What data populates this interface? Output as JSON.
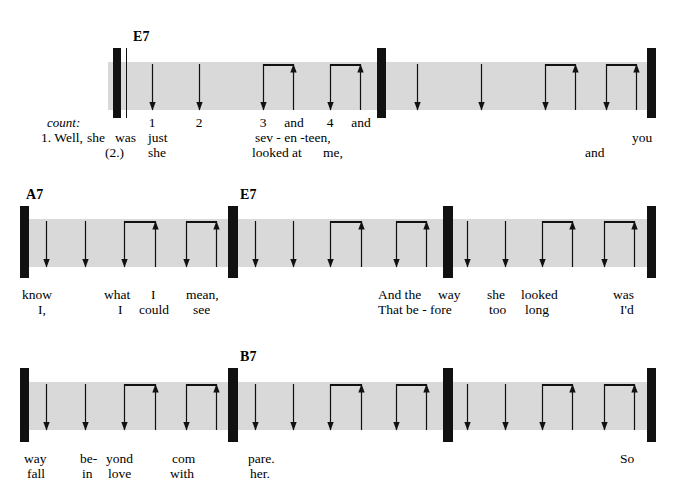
{
  "colors": {
    "band": "#d9d9d9",
    "ink": "#111111",
    "page": "#ffffff"
  },
  "labels": {
    "count": "count:"
  },
  "systems": [
    {
      "id": "system-1",
      "chords": [
        {
          "name": "E7",
          "x": 133,
          "y": 30
        }
      ],
      "measures": [
        {
          "id": "measure-1",
          "chord": "E7",
          "strokes": [
            {
              "beat": "1",
              "dir": "down",
              "x": 152
            },
            {
              "beat": "2",
              "dir": "down",
              "x": 199
            },
            {
              "beat": "3",
              "dir": "down",
              "x": 263
            },
            {
              "beat": "and",
              "dir": "up",
              "x": 293
            },
            {
              "beat": "4",
              "dir": "down",
              "x": 330
            },
            {
              "beat": "and",
              "dir": "up",
              "x": 360
            }
          ],
          "beams": [
            {
              "x1": 263,
              "x2": 293
            },
            {
              "x1": 330,
              "x2": 360
            }
          ]
        },
        {
          "id": "measure-2",
          "chord": "E7",
          "strokes": [
            {
              "beat": "1",
              "dir": "down",
              "x": 417
            },
            {
              "beat": "2",
              "dir": "down",
              "x": 481
            },
            {
              "beat": "3",
              "dir": "down",
              "x": 545
            },
            {
              "beat": "and",
              "dir": "up",
              "x": 575
            },
            {
              "beat": "4",
              "dir": "down",
              "x": 606
            },
            {
              "beat": "and",
              "dir": "up",
              "x": 636
            }
          ],
          "beams": [
            {
              "x1": 545,
              "x2": 575
            },
            {
              "x1": 606,
              "x2": 636
            }
          ]
        }
      ],
      "count_row": [
        {
          "text": "1",
          "x": 152
        },
        {
          "text": "2",
          "x": 199
        },
        {
          "text": "3",
          "x": 263
        },
        {
          "text": "and",
          "x": 294
        },
        {
          "text": "4",
          "x": 330
        },
        {
          "text": "and",
          "x": 361
        }
      ],
      "verse1": [
        {
          "text": "1. Well,",
          "x": 41,
          "align": "left"
        },
        {
          "text": "she",
          "x": 87,
          "align": "left"
        },
        {
          "text": "was",
          "x": 115,
          "align": "left"
        },
        {
          "text": "just",
          "x": 148,
          "align": "left"
        },
        {
          "text": "sev - en -teen,",
          "x": 255,
          "align": "left"
        },
        {
          "text": "you",
          "x": 632,
          "align": "left"
        }
      ],
      "verse2": [
        {
          "text": "(2.)",
          "x": 105,
          "align": "left"
        },
        {
          "text": "she",
          "x": 148,
          "align": "left"
        },
        {
          "text": "looked at",
          "x": 252,
          "align": "left"
        },
        {
          "text": "me,",
          "x": 323,
          "align": "left"
        },
        {
          "text": "and",
          "x": 585,
          "align": "left"
        }
      ]
    },
    {
      "id": "system-2",
      "chords": [
        {
          "name": "A7",
          "x": 26,
          "y": 188
        },
        {
          "name": "E7",
          "x": 240,
          "y": 188
        }
      ],
      "measures": [
        {
          "id": "measure-3",
          "chord": "A7",
          "strokes": [
            {
              "beat": "1",
              "dir": "down",
              "x": 46
            },
            {
              "beat": "2",
              "dir": "down",
              "x": 85
            },
            {
              "beat": "3",
              "dir": "down",
              "x": 124
            },
            {
              "beat": "and",
              "dir": "up",
              "x": 155
            },
            {
              "beat": "4",
              "dir": "down",
              "x": 186
            },
            {
              "beat": "and",
              "dir": "up",
              "x": 216
            }
          ],
          "beams": [
            {
              "x1": 124,
              "x2": 155
            },
            {
              "x1": 186,
              "x2": 216
            }
          ]
        },
        {
          "id": "measure-4",
          "chord": "E7",
          "strokes": [
            {
              "beat": "1",
              "dir": "down",
              "x": 255
            },
            {
              "beat": "2",
              "dir": "down",
              "x": 293
            },
            {
              "beat": "3",
              "dir": "down",
              "x": 330
            },
            {
              "beat": "and",
              "dir": "up",
              "x": 361
            },
            {
              "beat": "4",
              "dir": "down",
              "x": 396
            },
            {
              "beat": "and",
              "dir": "up",
              "x": 426
            }
          ],
          "beams": [
            {
              "x1": 330,
              "x2": 361
            },
            {
              "x1": 396,
              "x2": 426
            }
          ]
        },
        {
          "id": "measure-5",
          "chord": "E7",
          "strokes": [
            {
              "beat": "1",
              "dir": "down",
              "x": 467
            },
            {
              "beat": "2",
              "dir": "down",
              "x": 505
            },
            {
              "beat": "3",
              "dir": "down",
              "x": 542
            },
            {
              "beat": "and",
              "dir": "up",
              "x": 572
            },
            {
              "beat": "4",
              "dir": "down",
              "x": 604
            },
            {
              "beat": "and",
              "dir": "up",
              "x": 634
            }
          ],
          "beams": [
            {
              "x1": 542,
              "x2": 572
            },
            {
              "x1": 604,
              "x2": 634
            }
          ]
        }
      ],
      "count_row": [],
      "verse1": [
        {
          "text": "know",
          "x": 22,
          "align": "left"
        },
        {
          "text": "what",
          "x": 104,
          "align": "left"
        },
        {
          "text": "I",
          "x": 151,
          "align": "left"
        },
        {
          "text": "mean,",
          "x": 186,
          "align": "left"
        },
        {
          "text": "And the",
          "x": 378,
          "align": "left"
        },
        {
          "text": "way",
          "x": 438,
          "align": "left"
        },
        {
          "text": "she",
          "x": 487,
          "align": "left"
        },
        {
          "text": "looked",
          "x": 521,
          "align": "left"
        },
        {
          "text": "was",
          "x": 613,
          "align": "left"
        }
      ],
      "verse2": [
        {
          "text": "I,",
          "x": 38,
          "align": "left"
        },
        {
          "text": "I",
          "x": 118,
          "align": "left"
        },
        {
          "text": "could",
          "x": 139,
          "align": "left"
        },
        {
          "text": "see",
          "x": 193,
          "align": "left"
        },
        {
          "text": "That be - fore",
          "x": 378,
          "align": "left"
        },
        {
          "text": "too",
          "x": 489,
          "align": "left"
        },
        {
          "text": "long",
          "x": 525,
          "align": "left"
        },
        {
          "text": "I'd",
          "x": 620,
          "align": "left"
        }
      ]
    },
    {
      "id": "system-3",
      "chords": [
        {
          "name": "B7",
          "x": 240,
          "y": 350
        }
      ],
      "measures": [
        {
          "id": "measure-6",
          "chord": "",
          "strokes": [
            {
              "beat": "1",
              "dir": "down",
              "x": 46
            },
            {
              "beat": "2",
              "dir": "down",
              "x": 85
            },
            {
              "beat": "3",
              "dir": "down",
              "x": 124
            },
            {
              "beat": "and",
              "dir": "up",
              "x": 155
            },
            {
              "beat": "4",
              "dir": "down",
              "x": 186
            },
            {
              "beat": "and",
              "dir": "up",
              "x": 216
            }
          ],
          "beams": [
            {
              "x1": 124,
              "x2": 155
            },
            {
              "x1": 186,
              "x2": 216
            }
          ]
        },
        {
          "id": "measure-7",
          "chord": "B7",
          "strokes": [
            {
              "beat": "1",
              "dir": "down",
              "x": 255
            },
            {
              "beat": "2",
              "dir": "down",
              "x": 293
            },
            {
              "beat": "3",
              "dir": "down",
              "x": 330
            },
            {
              "beat": "and",
              "dir": "up",
              "x": 361
            },
            {
              "beat": "4",
              "dir": "down",
              "x": 396
            },
            {
              "beat": "and",
              "dir": "up",
              "x": 426
            }
          ],
          "beams": [
            {
              "x1": 330,
              "x2": 361
            },
            {
              "x1": 396,
              "x2": 426
            }
          ]
        },
        {
          "id": "measure-8",
          "chord": "B7",
          "strokes": [
            {
              "beat": "1",
              "dir": "down",
              "x": 467
            },
            {
              "beat": "2",
              "dir": "down",
              "x": 505
            },
            {
              "beat": "3",
              "dir": "down",
              "x": 542
            },
            {
              "beat": "and",
              "dir": "up",
              "x": 572
            },
            {
              "beat": "4",
              "dir": "down",
              "x": 604
            },
            {
              "beat": "and",
              "dir": "up",
              "x": 634
            }
          ],
          "beams": [
            {
              "x1": 542,
              "x2": 572
            },
            {
              "x1": 604,
              "x2": 634
            }
          ]
        }
      ],
      "count_row": [],
      "verse1": [
        {
          "text": "way",
          "x": 24,
          "align": "left"
        },
        {
          "text": "be-",
          "x": 80,
          "align": "left"
        },
        {
          "text": "yond",
          "x": 106,
          "align": "left"
        },
        {
          "text": "com",
          "x": 172,
          "align": "left"
        },
        {
          "text": "pare.",
          "x": 248,
          "align": "left"
        },
        {
          "text": "So",
          "x": 620,
          "align": "left"
        }
      ],
      "verse2": [
        {
          "text": "fall",
          "x": 27,
          "align": "left"
        },
        {
          "text": "in",
          "x": 82,
          "align": "left"
        },
        {
          "text": "love",
          "x": 108,
          "align": "left"
        },
        {
          "text": "with",
          "x": 170,
          "align": "left"
        },
        {
          "text": "her.",
          "x": 250,
          "align": "left"
        }
      ]
    }
  ],
  "geometry": {
    "systems": [
      {
        "band": {
          "x": 108,
          "y": 62,
          "w": 548,
          "h": 48
        },
        "barlines": [
          {
            "x": 113,
            "y": 48,
            "w": 8,
            "h": 70,
            "kind": "thick"
          },
          {
            "x": 377,
            "y": 48,
            "w": 9,
            "h": 70,
            "kind": "thick"
          },
          {
            "x": 647,
            "y": 48,
            "w": 9,
            "h": 70,
            "kind": "thick"
          }
        ],
        "thin_barlines": [
          {
            "x": 126,
            "y": 48,
            "h": 70
          }
        ],
        "arrow_top": 64,
        "arrow_bottom": 110,
        "beam_y": 64,
        "count_y": 116,
        "verse1_y": 131,
        "verse2_y": 146
      },
      {
        "band": {
          "x": 20,
          "y": 219,
          "w": 636,
          "h": 48
        },
        "barlines": [
          {
            "x": 20,
            "y": 206,
            "w": 9,
            "h": 72,
            "kind": "thick"
          },
          {
            "x": 228,
            "y": 206,
            "w": 10,
            "h": 72,
            "kind": "thick"
          },
          {
            "x": 443,
            "y": 206,
            "w": 10,
            "h": 72,
            "kind": "thick"
          },
          {
            "x": 647,
            "y": 206,
            "w": 9,
            "h": 72,
            "kind": "thick"
          }
        ],
        "thin_barlines": [],
        "arrow_top": 221,
        "arrow_bottom": 267,
        "beam_y": 221,
        "count_y": 0,
        "verse1_y": 288,
        "verse2_y": 303
      },
      {
        "band": {
          "x": 20,
          "y": 382,
          "w": 636,
          "h": 48
        },
        "barlines": [
          {
            "x": 20,
            "y": 368,
            "w": 9,
            "h": 74,
            "kind": "thick"
          },
          {
            "x": 228,
            "y": 368,
            "w": 10,
            "h": 74,
            "kind": "thick"
          },
          {
            "x": 443,
            "y": 368,
            "w": 10,
            "h": 74,
            "kind": "thick"
          },
          {
            "x": 647,
            "y": 368,
            "w": 9,
            "h": 74,
            "kind": "thick"
          }
        ],
        "thin_barlines": [],
        "arrow_top": 384,
        "arrow_bottom": 430,
        "beam_y": 384,
        "count_y": 0,
        "verse1_y": 452,
        "verse2_y": 467
      }
    ]
  }
}
